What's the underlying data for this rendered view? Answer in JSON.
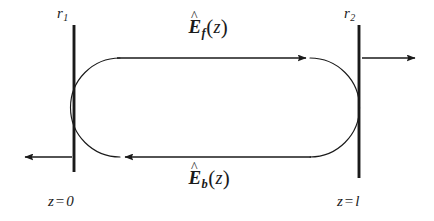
{
  "figure": {
    "name": "fabry-perot-cavity-field-diagram",
    "background_color": "#ffffff",
    "stroke_color": "#1a1a1a",
    "width": 434,
    "height": 221
  },
  "labels": {
    "mirror_left": {
      "symbol": "r",
      "subscript": "1",
      "text": "r1"
    },
    "mirror_right": {
      "symbol": "r",
      "subscript": "2",
      "text": "r2"
    },
    "field_forward": {
      "hat": "^",
      "symbol": "E",
      "subscript": "f",
      "open_paren": "(",
      "argument": "z",
      "close_paren": ")",
      "text": "Ef(z)"
    },
    "field_backward": {
      "hat": "^",
      "symbol": "E",
      "subscript": "b",
      "open_paren": "(",
      "argument": "z",
      "close_paren": ")",
      "text": "Eb(z)"
    },
    "coord_left": {
      "variable": "z",
      "equals": "=",
      "value": "0",
      "text": "z = 0"
    },
    "coord_right": {
      "variable": "z",
      "equals": "=",
      "value": "l",
      "text": "z = l"
    }
  },
  "elements": {
    "mirror_left": {
      "name": "left-mirror-bar",
      "x": 74,
      "y_top": 25,
      "y_bottom": 172
    },
    "mirror_right": {
      "name": "right-mirror-bar",
      "x": 359,
      "y_top": 25,
      "y_bottom": 178
    },
    "arrow_forward": {
      "name": "forward-field-arrow",
      "direction": "right",
      "x_start": 118,
      "x_end": 307,
      "y": 58
    },
    "arrow_backward": {
      "name": "backward-field-arrow",
      "direction": "left",
      "x_start": 305,
      "x_end": 124,
      "y": 157
    },
    "arrow_output_left": {
      "name": "left-output-arrow",
      "direction": "left",
      "x_start": 72,
      "x_end": 24,
      "y": 157
    },
    "arrow_output_right": {
      "name": "right-output-arrow",
      "direction": "right",
      "x_start": 362,
      "x_end": 416,
      "y": 58
    },
    "loop_arc_left": {
      "name": "left-loop-arc",
      "center_x": 120,
      "center_y": 107.5,
      "radius": 49.5
    },
    "loop_arc_right": {
      "name": "right-loop-arc",
      "center_x": 310,
      "center_y": 107.5,
      "radius": 49.5
    }
  }
}
